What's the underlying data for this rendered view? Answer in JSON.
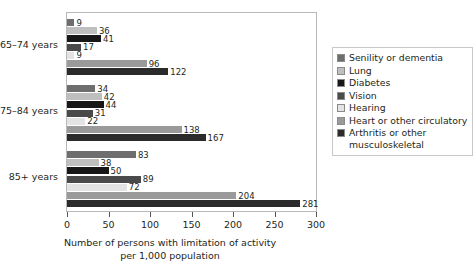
{
  "chart_data": {
    "type": "bar",
    "orientation": "horizontal",
    "title": "",
    "xlabel": "Number of persons with limitation of activity per 1,000 population",
    "xlabel_line1": "Number of persons with limitation of activity",
    "xlabel_line2": "per 1,000 population",
    "ylabel": "",
    "xlim": [
      0,
      300
    ],
    "xticks": [
      0,
      50,
      100,
      150,
      200,
      250,
      300
    ],
    "xticklabels": [
      "0",
      "50",
      "100",
      "150",
      "200",
      "250",
      "300"
    ],
    "grid": false,
    "legend_position": "right",
    "categories": [
      "65–74 years",
      "75–84 years",
      "85+ years"
    ],
    "series": [
      {
        "name": "Senility or dementia",
        "color": "#6e6e6e",
        "values": [
          9,
          34,
          83
        ]
      },
      {
        "name": "Lung",
        "color": "#bfbfbf",
        "values": [
          36,
          42,
          38
        ]
      },
      {
        "name": "Diabetes",
        "color": "#171717",
        "values": [
          41,
          44,
          50
        ]
      },
      {
        "name": "Vision",
        "color": "#4a4a4a",
        "values": [
          17,
          31,
          89
        ]
      },
      {
        "name": "Hearing",
        "color": "#e3e3e3",
        "values": [
          9,
          22,
          72
        ]
      },
      {
        "name": "Heart or other circulatory",
        "color": "#9a9a9a",
        "values": [
          96,
          138,
          204
        ]
      },
      {
        "name": "Arthritis or other musculoskeletal",
        "color": "#2b2b2b",
        "values": [
          122,
          167,
          281
        ]
      }
    ],
    "legend_entries": [
      {
        "label": "Senility or dementia",
        "color": "#6e6e6e"
      },
      {
        "label": "Lung",
        "color": "#bfbfbf"
      },
      {
        "label": "Diabetes",
        "color": "#171717"
      },
      {
        "label": "Vision",
        "color": "#4a4a4a"
      },
      {
        "label": "Hearing",
        "color": "#e3e3e3"
      },
      {
        "label": "Heart or other circulatory",
        "color": "#9a9a9a"
      },
      {
        "label": "Arthritis or other musculoskeletal",
        "color": "#2b2b2b"
      }
    ]
  }
}
